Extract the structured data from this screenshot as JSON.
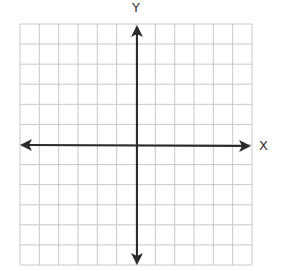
{
  "diagram": {
    "type": "coordinate-plane",
    "axes": {
      "x_label": "X",
      "y_label": "Y"
    },
    "grid": {
      "columns": 12,
      "rows": 12,
      "origin_column": 6,
      "origin_row": 6
    },
    "colors": {
      "grid": "#c8c8c8",
      "axis": "#2b2b2b",
      "background": "#ffffff",
      "label": "#333333"
    }
  }
}
